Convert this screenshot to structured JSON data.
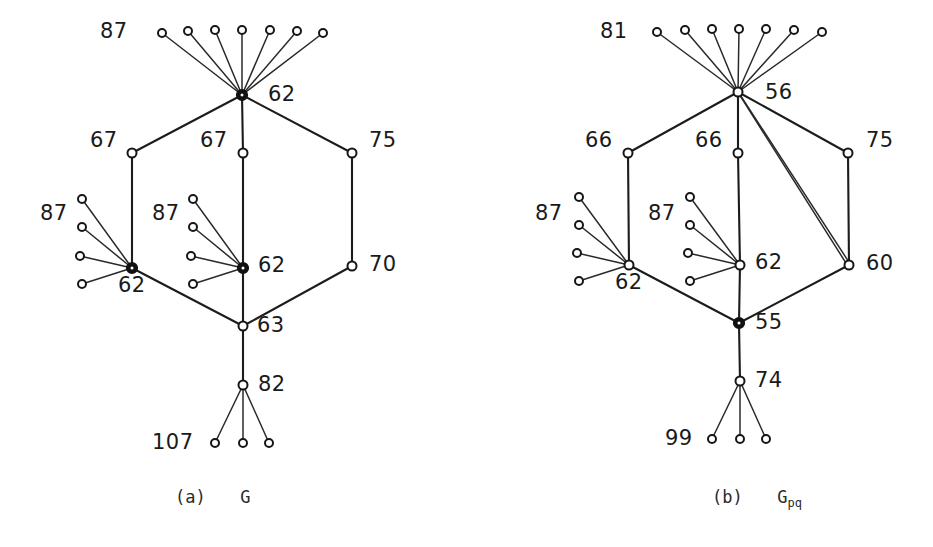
{
  "figure": {
    "background_color": "#ffffff",
    "ink_color": "#1a1a1a",
    "panels": [
      {
        "id": "panel-a",
        "caption_index": "(a)",
        "caption_name": "G",
        "caption_sub": "",
        "labels": [
          {
            "name": "label-a-top-leaves",
            "text": "87",
            "x": 100,
            "y": 21
          },
          {
            "name": "label-a-hub-top",
            "text": "62",
            "x": 268,
            "y": 84
          },
          {
            "name": "label-a-left-mid",
            "text": "67",
            "x": 90,
            "y": 130
          },
          {
            "name": "label-a-center-mid",
            "text": "67",
            "x": 200,
            "y": 130
          },
          {
            "name": "label-a-right-mid",
            "text": "75",
            "x": 369,
            "y": 130
          },
          {
            "name": "label-a-left-star-leaves",
            "text": "87",
            "x": 40,
            "y": 203
          },
          {
            "name": "label-a-center-star-leaves",
            "text": "87",
            "x": 152,
            "y": 203
          },
          {
            "name": "label-a-center-hub",
            "text": "62",
            "x": 258,
            "y": 255
          },
          {
            "name": "label-a-right-low",
            "text": "70",
            "x": 369,
            "y": 254
          },
          {
            "name": "label-a-left-hub",
            "text": "62",
            "x": 118,
            "y": 275
          },
          {
            "name": "label-a-junction",
            "text": "63",
            "x": 257,
            "y": 315
          },
          {
            "name": "label-a-stem",
            "text": "82",
            "x": 258,
            "y": 374
          },
          {
            "name": "label-a-bottom-leaves",
            "text": "107",
            "x": 152,
            "y": 432
          }
        ]
      },
      {
        "id": "panel-b",
        "caption_index": "(b)",
        "caption_name": "G",
        "caption_sub": "pq",
        "labels": [
          {
            "name": "label-b-top-leaves",
            "text": "81",
            "x": 600,
            "y": 21
          },
          {
            "name": "label-b-hub-top",
            "text": "56",
            "x": 765,
            "y": 82
          },
          {
            "name": "label-b-left-mid",
            "text": "66",
            "x": 585,
            "y": 130
          },
          {
            "name": "label-b-center-mid",
            "text": "66",
            "x": 695,
            "y": 130
          },
          {
            "name": "label-b-right-mid",
            "text": "75",
            "x": 866,
            "y": 130
          },
          {
            "name": "label-b-left-star-leaves",
            "text": "87",
            "x": 535,
            "y": 203
          },
          {
            "name": "label-b-center-star-leaves",
            "text": "87",
            "x": 648,
            "y": 203
          },
          {
            "name": "label-b-center-hub",
            "text": "62",
            "x": 755,
            "y": 252
          },
          {
            "name": "label-b-right-low",
            "text": "60",
            "x": 866,
            "y": 253
          },
          {
            "name": "label-b-left-hub",
            "text": "62",
            "x": 615,
            "y": 272
          },
          {
            "name": "label-b-junction",
            "text": "55",
            "x": 755,
            "y": 312
          },
          {
            "name": "label-b-stem",
            "text": "74",
            "x": 755,
            "y": 370
          },
          {
            "name": "label-b-bottom-leaves",
            "text": "99",
            "x": 665,
            "y": 428
          }
        ]
      }
    ]
  },
  "graph_data": {
    "type": "node-link-diagram",
    "panel_a": {
      "label": "G",
      "nodes": [
        {
          "id": "a-hub",
          "value": "62",
          "x": 242,
          "y": 95,
          "style": "bold",
          "r": 5
        },
        {
          "id": "a-top-leaf-1",
          "value": "",
          "x": 162,
          "y": 33,
          "style": "open",
          "r": 4
        },
        {
          "id": "a-top-leaf-2",
          "value": "",
          "x": 188,
          "y": 31,
          "style": "open",
          "r": 4
        },
        {
          "id": "a-top-leaf-3",
          "value": "",
          "x": 215,
          "y": 30,
          "style": "open",
          "r": 4
        },
        {
          "id": "a-top-leaf-4",
          "value": "",
          "x": 242,
          "y": 30,
          "style": "open",
          "r": 4
        },
        {
          "id": "a-top-leaf-5",
          "value": "",
          "x": 270,
          "y": 30,
          "style": "open",
          "r": 4
        },
        {
          "id": "a-top-leaf-6",
          "value": "",
          "x": 297,
          "y": 31,
          "style": "open",
          "r": 4
        },
        {
          "id": "a-top-leaf-7",
          "value": "",
          "x": 323,
          "y": 33,
          "style": "open",
          "r": 4
        },
        {
          "id": "a-mid-left",
          "value": "67",
          "x": 132,
          "y": 153,
          "style": "open",
          "r": 4.5
        },
        {
          "id": "a-mid-center",
          "value": "67",
          "x": 243,
          "y": 153,
          "style": "open",
          "r": 4.5
        },
        {
          "id": "a-mid-right",
          "value": "75",
          "x": 352,
          "y": 153,
          "style": "open",
          "r": 4.5
        },
        {
          "id": "a-left-hub",
          "value": "62",
          "x": 132,
          "y": 268,
          "style": "bold",
          "r": 5
        },
        {
          "id": "a-left-leaf-1",
          "value": "",
          "x": 82,
          "y": 199,
          "style": "open",
          "r": 4
        },
        {
          "id": "a-left-leaf-2",
          "value": "",
          "x": 82,
          "y": 227,
          "style": "open",
          "r": 4
        },
        {
          "id": "a-left-leaf-3",
          "value": "",
          "x": 80,
          "y": 256,
          "style": "open",
          "r": 4
        },
        {
          "id": "a-left-leaf-4",
          "value": "",
          "x": 82,
          "y": 284,
          "style": "open",
          "r": 4
        },
        {
          "id": "a-center-hub",
          "value": "62",
          "x": 243,
          "y": 268,
          "style": "bold",
          "r": 5
        },
        {
          "id": "a-center-leaf-1",
          "value": "",
          "x": 193,
          "y": 199,
          "style": "open",
          "r": 4
        },
        {
          "id": "a-center-leaf-2",
          "value": "",
          "x": 193,
          "y": 227,
          "style": "open",
          "r": 4
        },
        {
          "id": "a-center-leaf-3",
          "value": "",
          "x": 191,
          "y": 256,
          "style": "open",
          "r": 4
        },
        {
          "id": "a-center-leaf-4",
          "value": "",
          "x": 193,
          "y": 284,
          "style": "open",
          "r": 4
        },
        {
          "id": "a-right-low",
          "value": "70",
          "x": 352,
          "y": 266,
          "style": "open",
          "r": 4.5
        },
        {
          "id": "a-junction",
          "value": "63",
          "x": 243,
          "y": 326,
          "style": "open",
          "r": 4.5
        },
        {
          "id": "a-stem",
          "value": "82",
          "x": 243,
          "y": 385,
          "style": "open",
          "r": 4.5
        },
        {
          "id": "a-bot-leaf-1",
          "value": "",
          "x": 215,
          "y": 443,
          "style": "open",
          "r": 4
        },
        {
          "id": "a-bot-leaf-2",
          "value": "",
          "x": 243,
          "y": 443,
          "style": "open",
          "r": 4
        },
        {
          "id": "a-bot-leaf-3",
          "value": "",
          "x": 269,
          "y": 443,
          "style": "open",
          "r": 4
        }
      ],
      "edges": [
        {
          "from": "a-hub",
          "to": "a-top-leaf-1",
          "multiplicity": 1
        },
        {
          "from": "a-hub",
          "to": "a-top-leaf-2",
          "multiplicity": 1
        },
        {
          "from": "a-hub",
          "to": "a-top-leaf-3",
          "multiplicity": 1
        },
        {
          "from": "a-hub",
          "to": "a-top-leaf-4",
          "multiplicity": 1
        },
        {
          "from": "a-hub",
          "to": "a-top-leaf-5",
          "multiplicity": 1
        },
        {
          "from": "a-hub",
          "to": "a-top-leaf-6",
          "multiplicity": 1
        },
        {
          "from": "a-hub",
          "to": "a-top-leaf-7",
          "multiplicity": 1
        },
        {
          "from": "a-hub",
          "to": "a-mid-left",
          "multiplicity": 1
        },
        {
          "from": "a-hub",
          "to": "a-mid-center",
          "multiplicity": 1
        },
        {
          "from": "a-hub",
          "to": "a-mid-right",
          "multiplicity": 1
        },
        {
          "from": "a-mid-left",
          "to": "a-left-hub",
          "multiplicity": 1
        },
        {
          "from": "a-mid-center",
          "to": "a-center-hub",
          "multiplicity": 1
        },
        {
          "from": "a-mid-right",
          "to": "a-right-low",
          "multiplicity": 1
        },
        {
          "from": "a-left-hub",
          "to": "a-left-leaf-1",
          "multiplicity": 1
        },
        {
          "from": "a-left-hub",
          "to": "a-left-leaf-2",
          "multiplicity": 1
        },
        {
          "from": "a-left-hub",
          "to": "a-left-leaf-3",
          "multiplicity": 1
        },
        {
          "from": "a-left-hub",
          "to": "a-left-leaf-4",
          "multiplicity": 1
        },
        {
          "from": "a-center-hub",
          "to": "a-center-leaf-1",
          "multiplicity": 1
        },
        {
          "from": "a-center-hub",
          "to": "a-center-leaf-2",
          "multiplicity": 1
        },
        {
          "from": "a-center-hub",
          "to": "a-center-leaf-3",
          "multiplicity": 1
        },
        {
          "from": "a-center-hub",
          "to": "a-center-leaf-4",
          "multiplicity": 1
        },
        {
          "from": "a-left-hub",
          "to": "a-junction",
          "multiplicity": 1
        },
        {
          "from": "a-center-hub",
          "to": "a-junction",
          "multiplicity": 1
        },
        {
          "from": "a-right-low",
          "to": "a-junction",
          "multiplicity": 1
        },
        {
          "from": "a-junction",
          "to": "a-stem",
          "multiplicity": 1
        },
        {
          "from": "a-stem",
          "to": "a-bot-leaf-1",
          "multiplicity": 1
        },
        {
          "from": "a-stem",
          "to": "a-bot-leaf-2",
          "multiplicity": 1
        },
        {
          "from": "a-stem",
          "to": "a-bot-leaf-3",
          "multiplicity": 1
        }
      ]
    },
    "panel_b": {
      "label": "Gpq",
      "nodes": [
        {
          "id": "b-hub",
          "value": "56",
          "x": 738,
          "y": 92,
          "style": "open",
          "r": 4.5
        },
        {
          "id": "b-top-leaf-1",
          "value": "",
          "x": 657,
          "y": 32,
          "style": "open",
          "r": 4
        },
        {
          "id": "b-top-leaf-2",
          "value": "",
          "x": 685,
          "y": 30,
          "style": "open",
          "r": 4
        },
        {
          "id": "b-top-leaf-3",
          "value": "",
          "x": 712,
          "y": 29,
          "style": "open",
          "r": 4
        },
        {
          "id": "b-top-leaf-4",
          "value": "",
          "x": 739,
          "y": 29,
          "style": "open",
          "r": 4
        },
        {
          "id": "b-top-leaf-5",
          "value": "",
          "x": 766,
          "y": 29,
          "style": "open",
          "r": 4
        },
        {
          "id": "b-top-leaf-6",
          "value": "",
          "x": 794,
          "y": 30,
          "style": "open",
          "r": 4
        },
        {
          "id": "b-top-leaf-7",
          "value": "",
          "x": 822,
          "y": 32,
          "style": "open",
          "r": 4
        },
        {
          "id": "b-mid-left",
          "value": "66",
          "x": 628,
          "y": 153,
          "style": "open",
          "r": 4.5
        },
        {
          "id": "b-mid-center",
          "value": "66",
          "x": 738,
          "y": 153,
          "style": "open",
          "r": 4.5
        },
        {
          "id": "b-mid-right",
          "value": "75",
          "x": 848,
          "y": 153,
          "style": "open",
          "r": 4.5
        },
        {
          "id": "b-left-hub",
          "value": "62",
          "x": 629,
          "y": 265,
          "style": "open",
          "r": 4.5
        },
        {
          "id": "b-left-leaf-1",
          "value": "",
          "x": 579,
          "y": 197,
          "style": "open",
          "r": 4
        },
        {
          "id": "b-left-leaf-2",
          "value": "",
          "x": 579,
          "y": 225,
          "style": "open",
          "r": 4
        },
        {
          "id": "b-left-leaf-3",
          "value": "",
          "x": 577,
          "y": 253,
          "style": "open",
          "r": 4
        },
        {
          "id": "b-left-leaf-4",
          "value": "",
          "x": 579,
          "y": 281,
          "style": "open",
          "r": 4
        },
        {
          "id": "b-center-hub",
          "value": "62",
          "x": 740,
          "y": 265,
          "style": "open",
          "r": 4.5
        },
        {
          "id": "b-center-leaf-1",
          "value": "",
          "x": 690,
          "y": 197,
          "style": "open",
          "r": 4
        },
        {
          "id": "b-center-leaf-2",
          "value": "",
          "x": 690,
          "y": 225,
          "style": "open",
          "r": 4
        },
        {
          "id": "b-center-leaf-3",
          "value": "",
          "x": 688,
          "y": 253,
          "style": "open",
          "r": 4
        },
        {
          "id": "b-center-leaf-4",
          "value": "",
          "x": 690,
          "y": 281,
          "style": "open",
          "r": 4
        },
        {
          "id": "b-right-low",
          "value": "60",
          "x": 849,
          "y": 265,
          "style": "open",
          "r": 4.5
        },
        {
          "id": "b-junction",
          "value": "55",
          "x": 739,
          "y": 323,
          "style": "bold",
          "r": 5
        },
        {
          "id": "b-stem",
          "value": "74",
          "x": 740,
          "y": 381,
          "style": "open",
          "r": 4.5
        },
        {
          "id": "b-bot-leaf-1",
          "value": "",
          "x": 712,
          "y": 439,
          "style": "open",
          "r": 4
        },
        {
          "id": "b-bot-leaf-2",
          "value": "",
          "x": 740,
          "y": 439,
          "style": "open",
          "r": 4
        },
        {
          "id": "b-bot-leaf-3",
          "value": "",
          "x": 766,
          "y": 439,
          "style": "open",
          "r": 4
        }
      ],
      "edges": [
        {
          "from": "b-hub",
          "to": "b-top-leaf-1",
          "multiplicity": 1
        },
        {
          "from": "b-hub",
          "to": "b-top-leaf-2",
          "multiplicity": 1
        },
        {
          "from": "b-hub",
          "to": "b-top-leaf-3",
          "multiplicity": 1
        },
        {
          "from": "b-hub",
          "to": "b-top-leaf-4",
          "multiplicity": 1
        },
        {
          "from": "b-hub",
          "to": "b-top-leaf-5",
          "multiplicity": 1
        },
        {
          "from": "b-hub",
          "to": "b-top-leaf-6",
          "multiplicity": 1
        },
        {
          "from": "b-hub",
          "to": "b-top-leaf-7",
          "multiplicity": 1
        },
        {
          "from": "b-hub",
          "to": "b-mid-left",
          "multiplicity": 1
        },
        {
          "from": "b-hub",
          "to": "b-mid-center",
          "multiplicity": 1
        },
        {
          "from": "b-hub",
          "to": "b-mid-right",
          "multiplicity": 1
        },
        {
          "from": "b-hub",
          "to": "b-right-low",
          "multiplicity": 2
        },
        {
          "from": "b-mid-left",
          "to": "b-left-hub",
          "multiplicity": 1
        },
        {
          "from": "b-mid-center",
          "to": "b-center-hub",
          "multiplicity": 1
        },
        {
          "from": "b-mid-right",
          "to": "b-right-low",
          "multiplicity": 1
        },
        {
          "from": "b-left-hub",
          "to": "b-left-leaf-1",
          "multiplicity": 1
        },
        {
          "from": "b-left-hub",
          "to": "b-left-leaf-2",
          "multiplicity": 1
        },
        {
          "from": "b-left-hub",
          "to": "b-left-leaf-3",
          "multiplicity": 1
        },
        {
          "from": "b-left-hub",
          "to": "b-left-leaf-4",
          "multiplicity": 1
        },
        {
          "from": "b-center-hub",
          "to": "b-center-leaf-1",
          "multiplicity": 1
        },
        {
          "from": "b-center-hub",
          "to": "b-center-leaf-2",
          "multiplicity": 1
        },
        {
          "from": "b-center-hub",
          "to": "b-center-leaf-3",
          "multiplicity": 1
        },
        {
          "from": "b-center-hub",
          "to": "b-center-leaf-4",
          "multiplicity": 1
        },
        {
          "from": "b-left-hub",
          "to": "b-junction",
          "multiplicity": 1
        },
        {
          "from": "b-center-hub",
          "to": "b-junction",
          "multiplicity": 1
        },
        {
          "from": "b-right-low",
          "to": "b-junction",
          "multiplicity": 1
        },
        {
          "from": "b-junction",
          "to": "b-stem",
          "multiplicity": 1
        },
        {
          "from": "b-stem",
          "to": "b-bot-leaf-1",
          "multiplicity": 1
        },
        {
          "from": "b-stem",
          "to": "b-bot-leaf-2",
          "multiplicity": 1
        },
        {
          "from": "b-stem",
          "to": "b-bot-leaf-3",
          "multiplicity": 1
        }
      ]
    }
  },
  "captions": {
    "panel_a": {
      "index": "(a)",
      "name": "G",
      "sub": "",
      "x": 175,
      "y": 488
    },
    "panel_b": {
      "index": "(b)",
      "name": "G",
      "sub": "pq",
      "x": 712,
      "y": 488
    }
  }
}
